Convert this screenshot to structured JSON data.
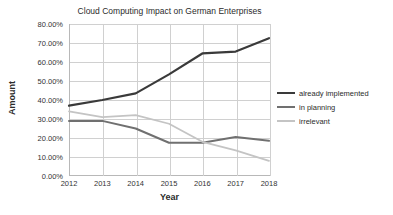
{
  "chart_data": {
    "type": "line",
    "title": "Cloud Computing Impact on German Enterprises",
    "xlabel": "Year",
    "ylabel": "Amount",
    "x": [
      2012,
      2013,
      2014,
      2015,
      2016,
      2017,
      2018
    ],
    "categories": [
      "2012",
      "2013",
      "2014",
      "2015",
      "2016",
      "2017",
      "2018"
    ],
    "ylim": [
      0,
      80
    ],
    "ytick_labels": [
      "0.00%",
      "10.00%",
      "20.00%",
      "30.00%",
      "40.00%",
      "50.00%",
      "60.00%",
      "70.00%",
      "80.00%"
    ],
    "ytick_values": [
      0,
      10,
      20,
      30,
      40,
      50,
      60,
      70,
      80
    ],
    "grid": "horizontal-and-vertical",
    "legend_position": "right",
    "series": [
      {
        "name": "already implemented",
        "color": "#3a3a3a",
        "width": 2.2,
        "values": [
          37.0,
          40.0,
          43.5,
          53.5,
          64.5,
          65.5,
          72.5
        ]
      },
      {
        "name": "in planning",
        "color": "#707070",
        "width": 2.0,
        "values": [
          29.0,
          29.0,
          25.0,
          17.5,
          17.5,
          20.5,
          18.5
        ]
      },
      {
        "name": "irrelevant",
        "color": "#c4c4c4",
        "width": 1.8,
        "values": [
          34.0,
          31.0,
          32.0,
          27.5,
          18.0,
          13.5,
          8.0
        ]
      }
    ]
  },
  "legend": {
    "items": [
      {
        "label": "already implemented"
      },
      {
        "label": "in planning"
      },
      {
        "label": "irrelevant"
      }
    ]
  },
  "axes": {
    "x_title": "Year",
    "y_title": "Amount"
  }
}
